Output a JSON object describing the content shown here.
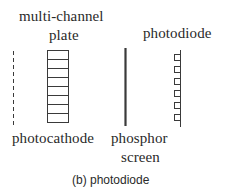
{
  "diagram": {
    "labels": {
      "mcp_line1": "multi-channel",
      "mcp_line2": "plate",
      "photodiode": "photodiode",
      "photocathode": "photocathode",
      "phosphor_line1": "phosphor",
      "phosphor_line2": "screen"
    },
    "caption": "(b) photodiode",
    "components": [
      {
        "name": "photocathode",
        "style": "dashed vertical line"
      },
      {
        "name": "multi-channel plate",
        "style": "rectangle with 8 channels"
      },
      {
        "name": "phosphor screen",
        "style": "solid thick vertical line"
      },
      {
        "name": "photodiode",
        "style": "vertical line with 6 square elements"
      }
    ],
    "colors": {
      "stroke": "#3a3a3a",
      "text": "#2a2a2a",
      "background": "#ffffff"
    }
  }
}
